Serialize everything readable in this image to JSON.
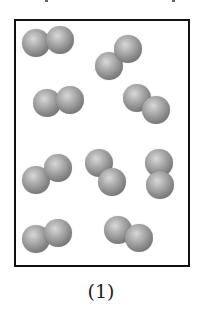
{
  "figure": {
    "caption": "(1)",
    "border_color": "#111111",
    "atom_color": "#8a8a8a",
    "molecule_count": 10,
    "molecules": [
      {
        "id": 1,
        "atoms": [
          {
            "x": 36,
            "y": 43
          },
          {
            "x": 60,
            "y": 40
          }
        ]
      },
      {
        "id": 2,
        "atoms": [
          {
            "x": 109,
            "y": 66
          },
          {
            "x": 128,
            "y": 49
          }
        ]
      },
      {
        "id": 3,
        "atoms": [
          {
            "x": 47,
            "y": 103
          },
          {
            "x": 70,
            "y": 100
          }
        ]
      },
      {
        "id": 4,
        "atoms": [
          {
            "x": 137,
            "y": 98
          },
          {
            "x": 156,
            "y": 110
          }
        ]
      },
      {
        "id": 5,
        "atoms": [
          {
            "x": 36,
            "y": 180
          },
          {
            "x": 58,
            "y": 168
          }
        ]
      },
      {
        "id": 6,
        "atoms": [
          {
            "x": 99,
            "y": 163
          },
          {
            "x": 112,
            "y": 182
          }
        ]
      },
      {
        "id": 7,
        "atoms": [
          {
            "x": 159,
            "y": 163
          },
          {
            "x": 160,
            "y": 185
          }
        ]
      },
      {
        "id": 8,
        "atoms": [
          {
            "x": 36,
            "y": 239
          },
          {
            "x": 58,
            "y": 233
          }
        ]
      },
      {
        "id": 9,
        "atoms": [
          {
            "x": 118,
            "y": 230
          },
          {
            "x": 139,
            "y": 238
          }
        ]
      }
    ]
  }
}
